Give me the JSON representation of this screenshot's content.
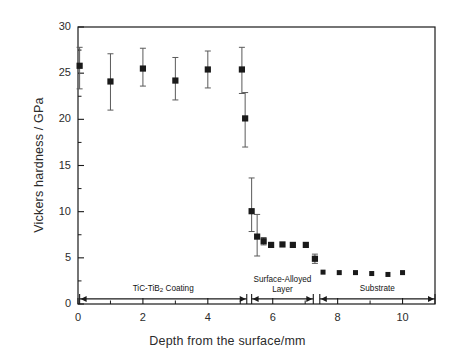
{
  "chart_data": {
    "type": "scatter",
    "title": "",
    "xlabel": "Depth from the surface/mm",
    "ylabel": "Vickers hardness / GPa",
    "xlim": [
      0,
      11
    ],
    "ylim": [
      0,
      30
    ],
    "xticks": [
      0,
      2,
      4,
      6,
      8,
      10
    ],
    "xticklabels": [
      "0",
      "2",
      "4",
      "6",
      "8",
      "10"
    ],
    "xminorticks": [
      1,
      3,
      5,
      7,
      9
    ],
    "yticks": [
      0,
      5,
      10,
      15,
      20,
      25,
      30
    ],
    "yticklabels": [
      "0",
      "5",
      "10",
      "15",
      "20",
      "25",
      "30"
    ],
    "yminorticks": [
      2.5,
      7.5,
      12.5,
      17.5,
      22.5,
      27.5
    ],
    "grid": false,
    "legend": "none",
    "marker": "filled-square",
    "marker_color": "#1a1a1a",
    "errorbar_color": "#5a5a5a",
    "series": [
      {
        "name": "Vickers hardness",
        "points": [
          {
            "x": 0.05,
            "y": 25.8,
            "err_low": 2.5,
            "err_high": 2.0
          },
          {
            "x": 1.0,
            "y": 24.1,
            "err_low": 3.1,
            "err_high": 3.0
          },
          {
            "x": 2.0,
            "y": 25.5,
            "err_low": 1.9,
            "err_high": 2.2
          },
          {
            "x": 3.0,
            "y": 24.2,
            "err_low": 2.1,
            "err_high": 2.5
          },
          {
            "x": 4.0,
            "y": 25.4,
            "err_low": 2.0,
            "err_high": 2.0
          },
          {
            "x": 5.05,
            "y": 25.4,
            "err_low": 2.6,
            "err_high": 2.4
          },
          {
            "x": 5.15,
            "y": 20.1,
            "err_low": 3.1,
            "err_high": 2.8
          },
          {
            "x": 5.35,
            "y": 10.05,
            "err_low": 2.2,
            "err_high": 3.6
          },
          {
            "x": 5.52,
            "y": 7.3,
            "err_low": 2.1,
            "err_high": 2.4
          },
          {
            "x": 5.72,
            "y": 6.8,
            "err_low": 0.4,
            "err_high": 0.4
          },
          {
            "x": 5.95,
            "y": 6.4,
            "err_low": 0.0,
            "err_high": 0.0
          },
          {
            "x": 6.3,
            "y": 6.45,
            "err_low": 0.0,
            "err_high": 0.0
          },
          {
            "x": 6.62,
            "y": 6.4,
            "err_low": 0.0,
            "err_high": 0.0
          },
          {
            "x": 7.02,
            "y": 6.4,
            "err_low": 0.0,
            "err_high": 0.0
          },
          {
            "x": 7.3,
            "y": 4.9,
            "err_low": 0.5,
            "err_high": 0.5
          },
          {
            "x": 7.55,
            "y": 3.45,
            "err_low": 0.0,
            "err_high": 0.0
          },
          {
            "x": 8.05,
            "y": 3.4,
            "err_low": 0.0,
            "err_high": 0.0
          },
          {
            "x": 8.55,
            "y": 3.4,
            "err_low": 0.0,
            "err_high": 0.0
          },
          {
            "x": 9.05,
            "y": 3.3,
            "err_low": 0.0,
            "err_high": 0.0
          },
          {
            "x": 9.55,
            "y": 3.2,
            "err_low": 0.0,
            "err_high": 0.0
          },
          {
            "x": 10.0,
            "y": 3.4,
            "err_low": 0.0,
            "err_high": 0.0
          }
        ]
      }
    ],
    "region_annotations": [
      {
        "id": "coating",
        "label_line1": "TiC-TiB",
        "label_sub": "2",
        "label_line2": " Coating",
        "x_start": 0.05,
        "x_end": 5.2,
        "y": 0.55
      },
      {
        "id": "surface-alloyed-layer",
        "label_line1": "Surface-Alloyed",
        "label_line2": "Layer",
        "x_start": 5.35,
        "x_end": 7.25,
        "y": 0.55
      },
      {
        "id": "substrate",
        "label_line1": "Substrate",
        "x_start": 7.45,
        "x_end": 11.0,
        "y": 0.55
      }
    ]
  }
}
